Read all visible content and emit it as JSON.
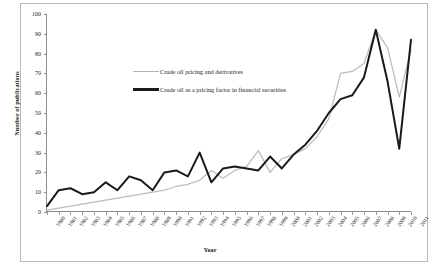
{
  "chart_data": {
    "type": "line",
    "title": "",
    "xlabel": "Year",
    "ylabel": "Number of publications",
    "xlim": [
      1980,
      2011
    ],
    "ylim": [
      0,
      100
    ],
    "ytick_step": 10,
    "grid": false,
    "legend_position": "upper-left-inside",
    "yticks": [
      0,
      10,
      20,
      30,
      40,
      50,
      60,
      70,
      80,
      90,
      100
    ],
    "categories": [
      "1980",
      "1981",
      "1982",
      "1983",
      "1984",
      "1985",
      "1986",
      "1987",
      "1988",
      "1989",
      "1990",
      "1991",
      "1992",
      "1993",
      "1994",
      "1995",
      "1996",
      "1997",
      "1998",
      "1999",
      "2000",
      "2001",
      "2002",
      "2003",
      "2004",
      "2005",
      "2006",
      "2007",
      "2008",
      "2009",
      "2010",
      "2011"
    ],
    "series": [
      {
        "name": "Crude oil pricing and derivatives",
        "color": "#bcbcbc",
        "values": [
          1,
          2,
          3,
          4,
          5,
          6,
          7,
          8,
          9,
          10,
          11,
          13,
          14,
          16,
          21,
          17,
          21,
          23,
          31,
          20,
          27,
          29,
          32,
          38,
          47,
          70,
          71,
          75,
          92,
          83,
          58,
          82
        ]
      },
      {
        "name": "Crude oil as a pricing factor in financial securities",
        "color": "#1a1a1a",
        "values": [
          3,
          11,
          12,
          9,
          10,
          15,
          11,
          18,
          16,
          11,
          20,
          21,
          18,
          30,
          15,
          22,
          23,
          22,
          21,
          28,
          22,
          29,
          34,
          41,
          50,
          57,
          59,
          68,
          92,
          66,
          32,
          87
        ]
      }
    ]
  },
  "axis": {
    "ylabel": "Number of publications",
    "xlabel": "Year"
  }
}
